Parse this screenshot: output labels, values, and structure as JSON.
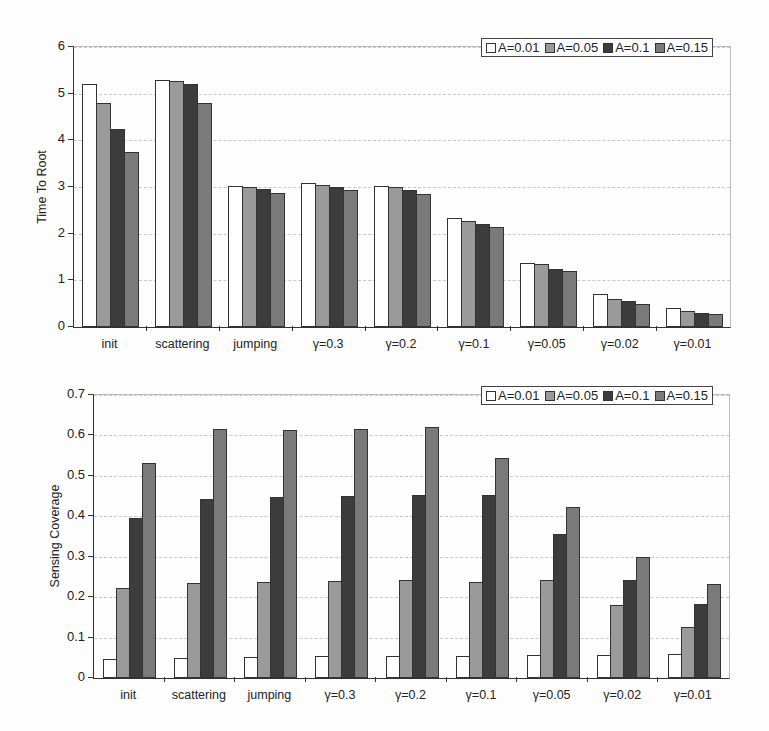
{
  "chart_data": [
    {
      "type": "bar",
      "title": "",
      "xlabel": "",
      "ylabel": "Time To Root",
      "ylim": [
        0,
        6
      ],
      "yticks": [
        "0",
        "1",
        "2",
        "3",
        "4",
        "5",
        "6"
      ],
      "grid": true,
      "legend_position": "top-right",
      "categories": [
        "init",
        "scattering",
        "jumping",
        "γ=0.3",
        "γ=0.2",
        "γ=0.1",
        "γ=0.05",
        "γ=0.02",
        "γ=0.01"
      ],
      "series": [
        {
          "name": "A=0.01",
          "color": "#ffffff",
          "values": [
            5.2,
            5.3,
            3.02,
            3.08,
            3.02,
            2.33,
            1.38,
            0.7,
            0.4
          ]
        },
        {
          "name": "A=0.05",
          "color": "#9a9a9a",
          "values": [
            4.8,
            5.28,
            3.0,
            3.05,
            3.0,
            2.28,
            1.35,
            0.6,
            0.35
          ]
        },
        {
          "name": "A=0.1",
          "color": "#3c3c3c",
          "values": [
            4.25,
            5.2,
            2.95,
            3.0,
            2.93,
            2.2,
            1.25,
            0.55,
            0.3
          ]
        },
        {
          "name": "A=0.15",
          "color": "#7a7a7a",
          "values": [
            3.75,
            4.8,
            2.88,
            2.93,
            2.86,
            2.15,
            1.2,
            0.5,
            0.28
          ]
        }
      ]
    },
    {
      "type": "bar",
      "title": "",
      "xlabel": "",
      "ylabel": "Sensing Coverage",
      "ylim": [
        0,
        0.7
      ],
      "yticks": [
        "0",
        "0.1",
        "0.2",
        "0.3",
        "0.4",
        "0.5",
        "0.6",
        "0.7"
      ],
      "grid": true,
      "legend_position": "top-right",
      "categories": [
        "init",
        "scattering",
        "jumping",
        "γ=0.3",
        "γ=0.2",
        "γ=0.1",
        "γ=0.05",
        "γ=0.02",
        "γ=0.01"
      ],
      "series": [
        {
          "name": "A=0.01",
          "color": "#ffffff",
          "values": [
            0.048,
            0.05,
            0.053,
            0.054,
            0.055,
            0.055,
            0.057,
            0.058,
            0.06
          ]
        },
        {
          "name": "A=0.05",
          "color": "#9a9a9a",
          "values": [
            0.222,
            0.235,
            0.237,
            0.24,
            0.242,
            0.237,
            0.242,
            0.18,
            0.125
          ]
        },
        {
          "name": "A=0.1",
          "color": "#3c3c3c",
          "values": [
            0.397,
            0.443,
            0.448,
            0.45,
            0.452,
            0.453,
            0.357,
            0.242,
            0.182
          ]
        },
        {
          "name": "A=0.15",
          "color": "#7a7a7a",
          "values": [
            0.533,
            0.615,
            0.613,
            0.617,
            0.62,
            0.543,
            0.423,
            0.3,
            0.232
          ]
        }
      ]
    }
  ]
}
